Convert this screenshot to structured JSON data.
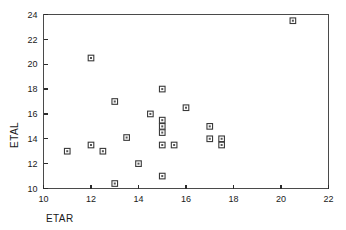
{
  "chart_data": {
    "type": "scatter",
    "title": "",
    "xlabel": "ETAR",
    "ylabel": "ETAL",
    "xlim": [
      10,
      22
    ],
    "ylim": [
      10,
      24
    ],
    "xticks": [
      10,
      12,
      14,
      16,
      18,
      20,
      22
    ],
    "yticks": [
      10,
      12,
      14,
      16,
      18,
      20,
      22,
      24
    ],
    "xtick_labels": [
      "10",
      "12",
      "14",
      "16",
      "18",
      "20",
      "22"
    ],
    "ytick_labels": [
      "10",
      "12",
      "14",
      "16",
      "18",
      "20",
      "22",
      "24"
    ],
    "grid": false,
    "legend": false,
    "marker": "open-square",
    "marker_color": "#3a3a3a",
    "frame_color": "#4a4a4a",
    "points": [
      {
        "x": 11.0,
        "y": 13.0
      },
      {
        "x": 12.0,
        "y": 20.5
      },
      {
        "x": 12.0,
        "y": 13.5
      },
      {
        "x": 12.5,
        "y": 13.0
      },
      {
        "x": 13.0,
        "y": 17.0
      },
      {
        "x": 13.0,
        "y": 10.4
      },
      {
        "x": 13.5,
        "y": 14.1
      },
      {
        "x": 14.0,
        "y": 12.0
      },
      {
        "x": 14.5,
        "y": 16.0
      },
      {
        "x": 15.0,
        "y": 18.0
      },
      {
        "x": 15.0,
        "y": 15.5
      },
      {
        "x": 15.0,
        "y": 15.0
      },
      {
        "x": 15.0,
        "y": 14.5
      },
      {
        "x": 15.0,
        "y": 13.5
      },
      {
        "x": 15.0,
        "y": 11.0
      },
      {
        "x": 15.5,
        "y": 13.5
      },
      {
        "x": 16.0,
        "y": 16.5
      },
      {
        "x": 17.0,
        "y": 15.0
      },
      {
        "x": 17.0,
        "y": 14.0
      },
      {
        "x": 17.5,
        "y": 14.0
      },
      {
        "x": 17.5,
        "y": 13.5
      },
      {
        "x": 20.5,
        "y": 23.5
      }
    ]
  },
  "axes": {
    "x_title": "ETAR",
    "y_title": "ETAL"
  }
}
